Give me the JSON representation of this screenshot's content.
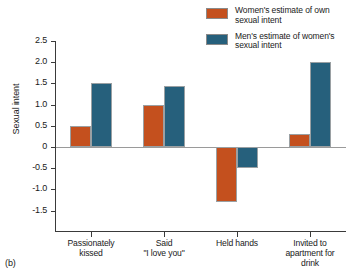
{
  "panel_label": "(b)",
  "legend": {
    "position": "top-right",
    "entries": [
      {
        "label": "Women's estimate of own sexual intent",
        "color": "#c4501e",
        "swatch_name": "legend-swatch-women"
      },
      {
        "label": "Men's estimate of women's sexual intent",
        "color": "#26607c",
        "swatch_name": "legend-swatch-men"
      }
    ]
  },
  "chart_data": {
    "type": "bar",
    "title": "",
    "subtitle": "",
    "xlabel": "",
    "ylabel": "Sexual intent",
    "ylim": [
      -1.5,
      2.5
    ],
    "ytick_step": 0.5,
    "ytick_labels": [
      "2.5",
      "2.0",
      "1.5",
      "1.0",
      "0.5",
      "0",
      "-0.5",
      "-1.0",
      "-1.5"
    ],
    "ytick_values": [
      2.5,
      2.0,
      1.5,
      1.0,
      0.5,
      0,
      -0.5,
      -1.0,
      -1.5
    ],
    "grid": false,
    "zero_line": true,
    "categories": [
      "Passionately kissed",
      "Said \"I love you\"",
      "Held hands",
      "Invited to apartment for drink"
    ],
    "category_lines": [
      [
        "Passionately",
        "kissed"
      ],
      [
        "Said",
        "\"I love you\""
      ],
      [
        "Held hands"
      ],
      [
        "Invited to",
        "apartment for",
        "drink"
      ]
    ],
    "series": [
      {
        "name": "Women's estimate of own sexual intent",
        "color": "#c4501e",
        "values": [
          0.5,
          1.0,
          -1.3,
          0.3
        ]
      },
      {
        "name": "Men's estimate of women's sexual intent",
        "color": "#26607c",
        "values": [
          1.5,
          1.45,
          -0.5,
          2.0
        ]
      }
    ]
  }
}
